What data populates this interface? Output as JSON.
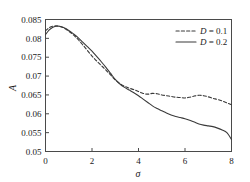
{
  "chart_data": {
    "type": "line",
    "title": "",
    "xlabel": "σ",
    "ylabel": "A",
    "xlim": [
      0,
      8
    ],
    "ylim": [
      0.05,
      0.085
    ],
    "xticks": [
      0,
      2,
      4,
      6,
      8
    ],
    "xtick_labels": [
      "0",
      "2",
      "4",
      "6",
      "8"
    ],
    "yticks": [
      0.05,
      0.055,
      0.06,
      0.065,
      0.07,
      0.075,
      0.08,
      0.085
    ],
    "ytick_labels": [
      "0.05",
      "0.055",
      "0.06",
      "0.065",
      "0.07",
      "0.075",
      "0.08",
      "0.085"
    ],
    "grid": false,
    "legend_position": "upper-right",
    "series": [
      {
        "name": "D = 0.1",
        "style": "dashed",
        "color": "#3a3a3a",
        "x": [
          0.0,
          0.15,
          0.3,
          0.45,
          0.6,
          0.8,
          1.0,
          1.2,
          1.4,
          1.6,
          1.8,
          2.0,
          2.2,
          2.4,
          2.6,
          2.8,
          3.0,
          3.2,
          3.4,
          3.6,
          3.8,
          4.0,
          4.2,
          4.4,
          4.6,
          4.8,
          5.0,
          5.2,
          5.4,
          5.6,
          5.8,
          6.0,
          6.2,
          6.4,
          6.6,
          6.8,
          7.0,
          7.2,
          7.4,
          7.6,
          7.8,
          8.0
        ],
        "y": [
          0.082,
          0.0828,
          0.0832,
          0.0833,
          0.0832,
          0.0827,
          0.0819,
          0.0809,
          0.0797,
          0.0783,
          0.0768,
          0.0753,
          0.074,
          0.0728,
          0.0716,
          0.0703,
          0.069,
          0.068,
          0.0673,
          0.0668,
          0.0664,
          0.0659,
          0.0654,
          0.0652,
          0.0654,
          0.0653,
          0.065,
          0.0648,
          0.0646,
          0.0644,
          0.0643,
          0.0642,
          0.0644,
          0.0647,
          0.0649,
          0.0648,
          0.0645,
          0.0641,
          0.0638,
          0.0634,
          0.0629,
          0.0624
        ]
      },
      {
        "name": "D = 0.2",
        "style": "solid",
        "color": "#3a3a3a",
        "x": [
          0.0,
          0.15,
          0.3,
          0.45,
          0.6,
          0.8,
          1.0,
          1.2,
          1.4,
          1.6,
          1.8,
          2.0,
          2.2,
          2.4,
          2.6,
          2.8,
          3.0,
          3.2,
          3.4,
          3.6,
          3.8,
          4.0,
          4.2,
          4.4,
          4.6,
          4.8,
          5.0,
          5.2,
          5.4,
          5.6,
          5.8,
          6.0,
          6.2,
          6.4,
          6.6,
          6.8,
          7.0,
          7.2,
          7.4,
          7.6,
          7.8,
          8.0
        ],
        "y": [
          0.081,
          0.0822,
          0.0829,
          0.0832,
          0.0832,
          0.0828,
          0.0821,
          0.0812,
          0.0802,
          0.079,
          0.0778,
          0.0766,
          0.0752,
          0.0738,
          0.0723,
          0.0707,
          0.0691,
          0.0679,
          0.067,
          0.0663,
          0.0656,
          0.0648,
          0.0639,
          0.063,
          0.0621,
          0.0614,
          0.0608,
          0.0602,
          0.0597,
          0.0593,
          0.059,
          0.0587,
          0.0583,
          0.0578,
          0.0573,
          0.057,
          0.0568,
          0.0566,
          0.0562,
          0.0557,
          0.055,
          0.0532
        ]
      }
    ]
  },
  "legend": {
    "entries": [
      {
        "label": "D = 0.1",
        "style": "dashed"
      },
      {
        "label": "D = 0.2",
        "style": "solid"
      }
    ]
  },
  "axes": {
    "y_title": "A",
    "x_title": "σ"
  }
}
